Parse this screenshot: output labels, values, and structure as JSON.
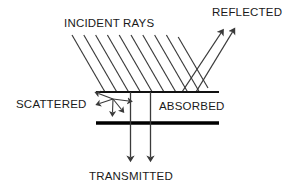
{
  "diagram": {
    "background_color": "#ffffff",
    "line_color": "#3a3a3a",
    "surface_color": "#000000",
    "text_color": "#1a1a1a",
    "labels": {
      "incident": "INCIDENT RAYS",
      "reflected": "REFLECTED",
      "scattered": "SCATTERED",
      "absorbed": "ABSORBED",
      "transmitted": "TRANSMITTED"
    },
    "geometry": {
      "surface_top_y": 92,
      "surface_bottom_y": 123,
      "surface_left_x": 96,
      "surface_right_x": 219,
      "incident_ray_count": 10,
      "incident_angle_deg": 60,
      "reflected_ray_count": 2,
      "transmitted_ray_count": 2,
      "scatter_arrow_count": 5,
      "scatter_origin_x": 113,
      "scatter_origin_y": 99
    }
  }
}
